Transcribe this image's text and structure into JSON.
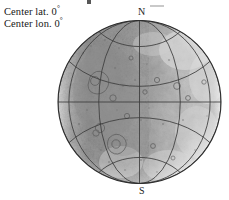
{
  "figure": {
    "type": "orthographic-globe-map",
    "body": "planetary-surface",
    "caption_lines": [
      {
        "text": "Center lat. 0",
        "degree": "°"
      },
      {
        "text": "Center lon. 0",
        "degree": "°"
      }
    ],
    "center_latitude": "0°",
    "center_longitude": "0°",
    "pole_labels": {
      "north": "N",
      "south": "S"
    },
    "graticule": {
      "meridian_interval_deg": 30,
      "parallel_interval_deg": 30,
      "meridians_deg": [
        -90,
        -60,
        -30,
        0,
        30,
        60,
        90
      ],
      "parallels_deg": [
        -60,
        -30,
        0,
        30,
        60
      ],
      "line_color": "#3c3c3c",
      "limb_color": "#2e2e2e"
    },
    "projection": {
      "name": "orthographic",
      "center": {
        "lat": 0,
        "lon": 0
      },
      "radius_px": 82,
      "center_px": {
        "x": 82,
        "y": 82
      }
    },
    "surface": {
      "description": "heavily cratered grey terrain, darker and rougher on the western (left) hemisphere, brighter smoother bands toward the eastern (right) limb",
      "base_color": "#a9a9a9",
      "dark_terrain_color": "#7e7e7e",
      "bright_terrain_color": "#d8d8d8",
      "limb_shadow_color": "#efefef"
    },
    "background_color": "#ffffff"
  }
}
